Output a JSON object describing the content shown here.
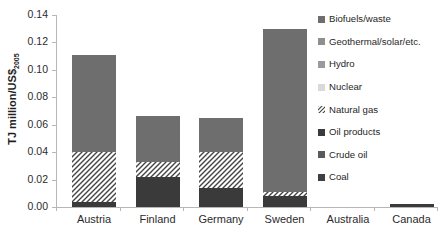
{
  "chart_data": {
    "type": "bar",
    "subtype": "stacked-bar",
    "title": "",
    "xlabel": "",
    "ylabel": "TJ million/US$2005",
    "ylabel_main": "TJ million/US$",
    "ylabel_sub": "2005",
    "ylim": [
      0,
      0.14
    ],
    "ytick_values": [
      0.0,
      0.02,
      0.04,
      0.06,
      0.08,
      0.1,
      0.12,
      0.14
    ],
    "ytick_labels": [
      "0.00",
      "0.02",
      "0.04",
      "0.06",
      "0.08",
      "0.10",
      "0.12",
      "0.14"
    ],
    "grid": false,
    "legend_position": "right",
    "categories": [
      "Austria",
      "Finland",
      "Germany",
      "Sweden",
      "Australia",
      "Canada"
    ],
    "series": [
      {
        "name": "Coal",
        "color": "#3f3f3f",
        "pattern": "solid",
        "values": [
          0.0,
          0.0,
          0.0,
          0.0,
          0.0,
          0.0
        ]
      },
      {
        "name": "Crude oil",
        "color": "#5a5a5a",
        "pattern": "solid",
        "values": [
          0.0,
          0.0,
          0.0,
          0.0,
          0.0,
          0.0
        ]
      },
      {
        "name": "Oil products",
        "color": "#3a3a3a",
        "pattern": "solid",
        "values": [
          0.004,
          0.022,
          0.014,
          0.008,
          0.0,
          0.002
        ]
      },
      {
        "name": "Natural gas",
        "color": "#ffffff",
        "pattern": "hatch",
        "values": [
          0.036,
          0.011,
          0.026,
          0.003,
          0.0,
          0.0
        ]
      },
      {
        "name": "Nuclear",
        "color": "#d9d9d9",
        "pattern": "solid",
        "values": [
          0.0,
          0.0,
          0.0,
          0.0,
          0.0,
          0.0
        ]
      },
      {
        "name": "Hydro",
        "color": "#9a9a9a",
        "pattern": "solid",
        "values": [
          0.0,
          0.0,
          0.0,
          0.0,
          0.0,
          0.0
        ]
      },
      {
        "name": "Geothermal/solar/etc.",
        "color": "#8f8f8f",
        "pattern": "solid",
        "values": [
          0.0,
          0.0,
          0.0,
          0.0,
          0.0,
          0.0
        ]
      },
      {
        "name": "Biofuels/waste",
        "color": "#6e6e6e",
        "pattern": "solid",
        "values": [
          0.071,
          0.033,
          0.025,
          0.119,
          0.0,
          0.0
        ]
      }
    ],
    "totals": [
      0.111,
      0.066,
      0.065,
      0.13,
      0.0,
      0.002
    ]
  },
  "legend": {
    "items": [
      {
        "label": "Biofuels/waste",
        "swatch": "#6e6e6e",
        "pattern": "solid"
      },
      {
        "label": "Geothermal/solar/etc.",
        "swatch": "#8f8f8f",
        "pattern": "solid"
      },
      {
        "label": "Hydro",
        "swatch": "#9a9a9a",
        "pattern": "solid"
      },
      {
        "label": "Nuclear",
        "swatch": "#d9d9d9",
        "pattern": "solid"
      },
      {
        "label": "Natural gas",
        "swatch": "#ffffff",
        "pattern": "hatch"
      },
      {
        "label": "Oil products",
        "swatch": "#3a3a3a",
        "pattern": "solid"
      },
      {
        "label": "Crude oil",
        "swatch": "#5a5a5a",
        "pattern": "solid"
      },
      {
        "label": "Coal",
        "swatch": "#3f3f3f",
        "pattern": "solid"
      }
    ]
  }
}
